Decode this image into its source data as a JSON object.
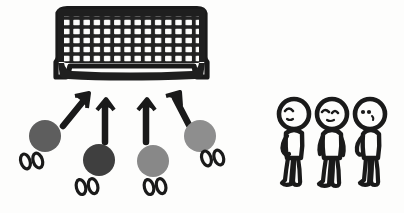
{
  "diagram": {
    "background_color": "#fdfdfc",
    "ink_color": "#1a1a1a",
    "caption": ""
  },
  "goal": {
    "label": "soccer goal with net",
    "x": 56,
    "y": 8,
    "width": 150,
    "height": 76,
    "frame_color": "#1f1f1f",
    "mesh_columns": 14,
    "mesh_rows": 8,
    "mesh_color": "#252525"
  },
  "balls": [
    {
      "label": "ball-1",
      "cx": 45,
      "cy": 136,
      "r": 16,
      "color": "#5e5e5e"
    },
    {
      "label": "ball-2",
      "cx": 99,
      "cy": 160,
      "r": 16,
      "color": "#3f3f3f"
    },
    {
      "label": "ball-3",
      "cx": 153,
      "cy": 161,
      "r": 16,
      "color": "#888888"
    },
    {
      "label": "ball-4",
      "cx": 200,
      "cy": 136,
      "r": 16,
      "color": "#8e8e8e"
    }
  ],
  "footprints": [
    {
      "label": "footprints-1",
      "x": 16,
      "y": 155,
      "rotate": -18
    },
    {
      "label": "footprints-2",
      "x": 72,
      "y": 180,
      "rotate": -14
    },
    {
      "label": "footprints-3",
      "x": 140,
      "y": 180,
      "rotate": -14
    },
    {
      "label": "footprints-4",
      "x": 197,
      "y": 152,
      "rotate": -18
    }
  ],
  "arrows": [
    {
      "label": "arrow-1",
      "x1": 62,
      "y1": 121,
      "x2": 87,
      "y2": 94,
      "angle": -47
    },
    {
      "label": "arrow-2",
      "x1": 104,
      "y1": 140,
      "x2": 106,
      "y2": 98,
      "angle": -2
    },
    {
      "label": "arrow-3",
      "x1": 146,
      "y1": 140,
      "x2": 145,
      "y2": 98,
      "angle": 2
    },
    {
      "label": "arrow-4",
      "x1": 190,
      "y1": 121,
      "x2": 175,
      "y2": 92,
      "angle": 28
    }
  ],
  "figures": [
    {
      "label": "player-1",
      "x": 272,
      "y": 96,
      "head_cx": 22,
      "head_cy": 18,
      "head_r": 15,
      "face": "closed-eye-left",
      "facing": "left"
    },
    {
      "label": "player-2",
      "x": 310,
      "y": 96,
      "head_cx": 22,
      "head_cy": 18,
      "head_r": 15,
      "face": "closed-eyes-wavy",
      "facing": "front"
    },
    {
      "label": "player-3",
      "x": 348,
      "y": 96,
      "head_cx": 22,
      "head_cy": 18,
      "head_r": 15,
      "face": "two-dot-eyes",
      "facing": "front"
    }
  ]
}
